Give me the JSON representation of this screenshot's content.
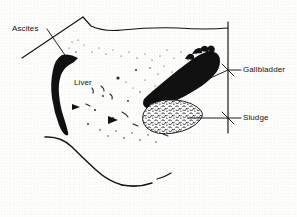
{
  "figure": {
    "type": "medical-line-drawing",
    "background_color": "#fdfdfc",
    "ink_color": "#141414"
  },
  "labels": {
    "ascites": "Ascites",
    "liver": "Liver",
    "gallbladder": "Gallbladder",
    "sludge": "Sludge"
  },
  "structures": [
    {
      "name": "ascites",
      "label": "Ascites",
      "fill": "solid-black",
      "description": "anechoic crescent of free fluid at the left, drawn as a solid black tapering crescent"
    },
    {
      "name": "liver",
      "label": "Liver",
      "fill": "stippled",
      "description": "central parenchyma rendered with scattered speckle texture"
    },
    {
      "name": "gallbladder",
      "label": "Gallbladder",
      "fill": "solid-black",
      "description": "elongated solid black lumen running obliquely down to the left"
    },
    {
      "name": "sludge",
      "label": "Sludge",
      "fill": "mottled-stipple",
      "description": "dependent echogenic material filling the lower gallbladder, drawn as a mottled oval"
    }
  ],
  "leader_lines": [
    {
      "for": "Ascites",
      "from": "label-right",
      "to": "ascites-crescent"
    },
    {
      "for": "Gallbladder",
      "from": "bracket",
      "to": "gallbladder-body"
    },
    {
      "for": "Sludge",
      "from": "bracket",
      "to": "sludge-oval"
    }
  ]
}
